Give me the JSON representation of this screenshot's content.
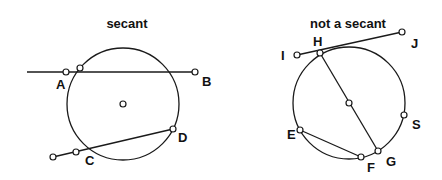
{
  "panels": [
    {
      "title": "secant",
      "labels": {
        "A": "A",
        "B": "B",
        "C": "C",
        "D": "D"
      }
    },
    {
      "title": "not a secant",
      "labels": {
        "H": "H",
        "I": "I",
        "J": "J",
        "E": "E",
        "F": "F",
        "G": "G",
        "S": "S"
      }
    }
  ],
  "colors": {
    "line": "#1a1a1a",
    "background": "#ffffff"
  }
}
